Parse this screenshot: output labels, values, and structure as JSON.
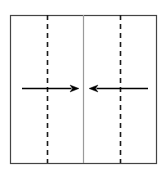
{
  "figure": {
    "title": "",
    "caption": "",
    "background_color": "#ffffff",
    "canvas": {
      "width": 165,
      "height": 172
    }
  },
  "diagram_data": {
    "type": "schematic",
    "description": "Rectangular region bisected by a solid vertical center line, flanked by two vertical dashed lines, with two horizontal arrows pointing inward toward the center line",
    "frame": {
      "name": "outer-rectangle",
      "x": 10,
      "y": 15,
      "width": 146,
      "height": 148,
      "stroke_color": "#444444",
      "stroke_width": 1.2,
      "fill": "none"
    },
    "vertical_lines": [
      {
        "name": "left-dashed-line",
        "x": 47,
        "y_top": 15,
        "y_bottom": 163,
        "style": "dashed",
        "dash_pattern": "5,4",
        "stroke_color": "#1a1a1a",
        "stroke_width": 1.6
      },
      {
        "name": "center-solid-line",
        "x": 83,
        "y_top": 15,
        "y_bottom": 163,
        "style": "solid",
        "dash_pattern": "",
        "stroke_color": "#9a9a9a",
        "stroke_width": 1.2
      },
      {
        "name": "right-dashed-line",
        "x": 120,
        "y_top": 15,
        "y_bottom": 163,
        "style": "dashed",
        "dash_pattern": "5,4",
        "stroke_color": "#1a1a1a",
        "stroke_width": 1.6
      }
    ],
    "arrows": [
      {
        "name": "left-arrow-pointing-right",
        "direction": "right",
        "tail_x": 22,
        "tip_x": 79,
        "y": 88,
        "stroke_color": "#000000",
        "stroke_width": 1.4,
        "head_length": 9,
        "head_width": 7,
        "label": ""
      },
      {
        "name": "right-arrow-pointing-left",
        "direction": "left",
        "tail_x": 148,
        "tip_x": 89,
        "y": 88,
        "stroke_color": "#000000",
        "stroke_width": 1.4,
        "head_length": 9,
        "head_width": 7,
        "label": ""
      }
    ],
    "labels": []
  }
}
